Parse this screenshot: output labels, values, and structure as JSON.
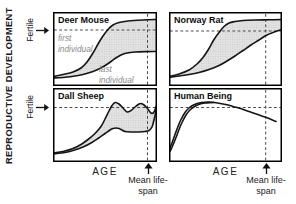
{
  "figure": {
    "y_axis_label": "REPRODUCTIVE DEVELOPMENT",
    "fertile_label": "Fertile",
    "age_label": "AGE",
    "lifespan_label": "Mean life-span",
    "colors": {
      "line": "#151515",
      "frame": "#000000",
      "dashed": "#4a4a4a",
      "band_fill": "#e2e2e2",
      "band_dots": "#c2c2c2",
      "muted_text": "#8a8a8a",
      "background": "#ffffff"
    }
  },
  "chart_data": [
    {
      "type": "line",
      "title": "Deer Mouse",
      "xlabel": "AGE",
      "qualitative_axes": true,
      "size": [
        104,
        74
      ],
      "band": true,
      "fertile_line_y": 18,
      "lifespan_line_x": 94.5,
      "annotations": [
        {
          "text": "first individual"
        },
        {
          "text": "last individual"
        }
      ],
      "series": [
        {
          "name": "first individual",
          "points": [
            [
              0,
              64.5
            ],
            [
              10,
              62.5
            ],
            [
              20,
              60
            ],
            [
              28,
              56
            ],
            [
              34,
              50
            ],
            [
              40,
              41
            ],
            [
              45,
              32
            ],
            [
              50,
              24
            ],
            [
              55,
              17.5
            ],
            [
              60,
              13
            ],
            [
              66,
              10.5
            ],
            [
              75,
              9
            ],
            [
              90,
              8
            ],
            [
              104,
              7.5
            ]
          ]
        },
        {
          "name": "last individual",
          "points": [
            [
              0,
              66
            ],
            [
              12,
              65.2
            ],
            [
              22,
              64
            ],
            [
              30,
              62.5
            ],
            [
              40,
              59.5
            ],
            [
              48,
              56
            ],
            [
              56,
              51
            ],
            [
              62,
              46.5
            ],
            [
              68,
              43
            ],
            [
              74,
              41
            ],
            [
              82,
              40
            ],
            [
              92,
              39.6
            ],
            [
              104,
              39.5
            ]
          ]
        }
      ]
    },
    {
      "type": "line",
      "title": "Norway Rat",
      "xlabel": "AGE",
      "qualitative_axes": true,
      "size": [
        113,
        74
      ],
      "band": true,
      "fertile_line_y": 19,
      "lifespan_line_x": 96.7,
      "annotations": [],
      "series": [
        {
          "points": [
            [
              0,
              64.5
            ],
            [
              10,
              62
            ],
            [
              20,
              58
            ],
            [
              28,
              52
            ],
            [
              34,
              45.5
            ],
            [
              40,
              36.5
            ],
            [
              45,
              27.5
            ],
            [
              50,
              20.5
            ],
            [
              55,
              14.5
            ],
            [
              60,
              11
            ],
            [
              66,
              9.5
            ],
            [
              74,
              8.5
            ],
            [
              86,
              8
            ],
            [
              100,
              7.8
            ],
            [
              113,
              7.5
            ]
          ]
        },
        {
          "points": [
            [
              0,
              65.5
            ],
            [
              10,
              64
            ],
            [
              20,
              62.5
            ],
            [
              30,
              60.5
            ],
            [
              40,
              57.5
            ],
            [
              50,
              53.5
            ],
            [
              58,
              49
            ],
            [
              66,
              44
            ],
            [
              74,
              38.5
            ],
            [
              82,
              33
            ],
            [
              90,
              28
            ],
            [
              97,
              23.5
            ],
            [
              104,
              20.5
            ],
            [
              113,
              17.5
            ]
          ]
        }
      ]
    },
    {
      "type": "line",
      "title": "Dall Sheep",
      "xlabel": "AGE",
      "qualitative_axes": true,
      "size": [
        104,
        74
      ],
      "band": true,
      "fertile_line_y": 19.5,
      "lifespan_line_x": 94.5,
      "annotations": [],
      "series": [
        {
          "points": [
            [
              0,
              65
            ],
            [
              10,
              63.5
            ],
            [
              20,
              60.5
            ],
            [
              28,
              56.5
            ],
            [
              35,
              51.5
            ],
            [
              42,
              45.5
            ],
            [
              48,
              38.5
            ],
            [
              52,
              31
            ],
            [
              56,
              23
            ],
            [
              59,
              17.5
            ],
            [
              62,
              14.5
            ],
            [
              66,
              16
            ],
            [
              70,
              20
            ],
            [
              74,
              24
            ],
            [
              78,
              22.5
            ],
            [
              82,
              19
            ],
            [
              86,
              16
            ],
            [
              88,
              15.5
            ],
            [
              91,
              17
            ],
            [
              94,
              20
            ],
            [
              97,
              24
            ],
            [
              99,
              25.5
            ],
            [
              101,
              24
            ],
            [
              103,
              19
            ],
            [
              104,
              16.5
            ]
          ]
        },
        {
          "points": [
            [
              0,
              66
            ],
            [
              12,
              64.5
            ],
            [
              20,
              62.5
            ],
            [
              30,
              59
            ],
            [
              38,
              55
            ],
            [
              45,
              50.5
            ],
            [
              52,
              45.5
            ],
            [
              57,
              42
            ],
            [
              60,
              40.5
            ],
            [
              63,
              40
            ],
            [
              66,
              40.5
            ],
            [
              69,
              42
            ],
            [
              72,
              43.5
            ],
            [
              78,
              44
            ],
            [
              86,
              44
            ],
            [
              92,
              43.5
            ],
            [
              96,
              42.5
            ],
            [
              99,
              39
            ],
            [
              101,
              32
            ],
            [
              103,
              23
            ],
            [
              104,
              16.5
            ]
          ]
        }
      ]
    },
    {
      "type": "line",
      "title": "Human Being",
      "xlabel": "AGE",
      "qualitative_axes": true,
      "size": [
        113,
        74
      ],
      "band": false,
      "fertile_line_y": 19.5,
      "lifespan_line_x": 96.7,
      "annotations": [],
      "series": [
        {
          "points": [
            [
              0,
              62
            ],
            [
              3,
              55
            ],
            [
              6,
              46.5
            ],
            [
              9,
              38.5
            ],
            [
              12,
              31.5
            ],
            [
              16,
              24.5
            ],
            [
              20,
              20
            ],
            [
              25,
              16.8
            ],
            [
              30,
              15
            ],
            [
              36,
              14.2
            ],
            [
              42,
              14.2
            ],
            [
              50,
              15.2
            ],
            [
              58,
              16.8
            ],
            [
              66,
              19
            ],
            [
              75,
              21.7
            ],
            [
              85,
              25.2
            ],
            [
              96.7,
              29.3
            ],
            [
              107,
              33.5
            ]
          ]
        },
        {
          "points": [
            [
              1,
              63.5
            ],
            [
              4,
              57
            ],
            [
              7,
              49.5
            ],
            [
              10,
              41.5
            ],
            [
              13,
              34.5
            ],
            [
              17,
              27
            ],
            [
              21,
              22
            ],
            [
              26,
              18.3
            ],
            [
              31,
              16
            ],
            [
              36,
              15
            ],
            [
              41,
              14.6
            ],
            [
              45,
              14.5
            ]
          ]
        }
      ]
    }
  ]
}
